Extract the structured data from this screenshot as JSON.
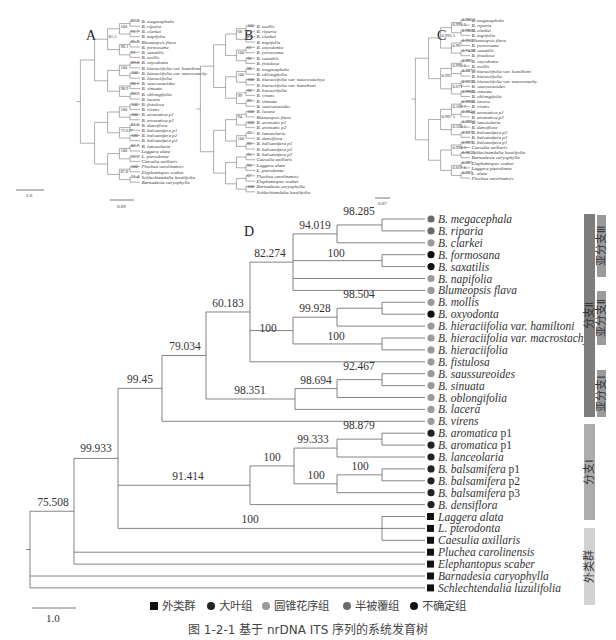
{
  "figure": {
    "caption": "图 1-2-1   基于 nrDNA ITS 序列的系统发育树",
    "legend": [
      {
        "symbol": "square",
        "color": "#111111",
        "label": "外类群"
      },
      {
        "symbol": "circle",
        "color": "#222222",
        "label": "大叶组"
      },
      {
        "symbol": "circle",
        "color": "#9a9a9a",
        "label": "圆锥花序组"
      },
      {
        "symbol": "circle",
        "color": "#6a6a6a",
        "label": "半被覆组"
      },
      {
        "symbol": "circle",
        "color": "#111111",
        "label": "不确定组"
      }
    ]
  },
  "panels": {
    "A": {
      "label": "A",
      "scale": "2.0",
      "taxa": [
        "B. megacephala",
        "B. riparia",
        "B. clarkei",
        "B. napifolia",
        "Blumeopsis flava",
        "B. formosana",
        "B. saxatilis",
        "B. mollis",
        "B. oxyodonta",
        "B. hieraciifolia var. hamiltoni",
        "B. hieraciifolia var. macrostachy",
        "B. hieraciifolia",
        "B. saussureoides",
        "B. sinuata",
        "B. oblongifolia",
        "B. lacera",
        "B. fistulosa",
        "B. virens",
        "B. aromatica p1",
        "B. aromatica p2",
        "B. densiflora",
        "B. balsamifera p1",
        "B. balsamifera p2",
        "B. balsamifera p3",
        "B. lanceolaria",
        "Laggera alata",
        "L. pterodonta",
        "Caesulia axillaris",
        "Pluchea carolinensis",
        "Elephantopus scaber",
        "Schlechtendalia luzulifolia",
        "Barnadesia caryophylla"
      ],
      "supports": [
        "97.9",
        "91.7",
        "85.9",
        "91",
        "89.8",
        "100",
        "98.1",
        "99.7",
        "100",
        "100",
        "81.6",
        "100",
        "82.7",
        "52.2",
        "100",
        "71.4",
        "100",
        "98.1",
        "100",
        "98.9",
        "100",
        "72.617",
        "100",
        "87.8",
        "81.5"
      ]
    },
    "B": {
      "label": "B",
      "scale": "0.09",
      "taxa": [
        "B. mollis",
        "B. riparia",
        "B. clarkei",
        "B. napifolia",
        "B. oxyodonta",
        "B. formosana",
        "B. saxatilis",
        "B. fistulosa",
        "B. megacephala",
        "B. oblongifolia",
        "B. hieraciifolia var. macrostachya",
        "B. hieraciifolia var. hamiltoni",
        "B. hieraciifolia",
        "B. virens",
        "B. sinuata",
        "B. saussureoides",
        "B. lacera",
        "Blumeopsis flava",
        "B. aromatic p1",
        "B. aromatic p2",
        "B. lanceolaria",
        "B. densiflora",
        "B. balsamifera p1",
        "B. balsamifera p2",
        "B. balsamifera p3",
        "Caesulia axillaris",
        "Laggera alata",
        "L. pterodonta",
        "Pluchea carolinensis",
        "Elephantopus scaber",
        "Barnadesia caryophylla",
        "Schlechtendalia luzulifolia"
      ],
      "supports": [
        "100",
        "97",
        "61",
        "96",
        "98",
        "100",
        "98",
        "99",
        "100",
        "100",
        "73",
        "99",
        "95",
        "99",
        "67",
        "100",
        "68",
        "100",
        "100",
        "99",
        "94",
        "100"
      ]
    },
    "C": {
      "label": "C",
      "scale": "0.07",
      "taxa": [
        "B. megacephala",
        "B. riparia",
        "B. clarkei",
        "B. napifolia",
        "Blumeopsis flava",
        "B. formosana",
        "B. saxatilis",
        "B. fistulosa",
        "B. oxyodonta",
        "B. mollis",
        "B. hieraciifolia var. hamiltoni",
        "B. hieraciifolia",
        "B. hieraciifolia var. macrostachy",
        "B. saussureoides",
        "B. sinuata",
        "B. oblongifolia",
        "B. lacera",
        "B. virens",
        "B. aromatica p1",
        "B. aromatica p2",
        "B. lanceolaria",
        "B. densiflora",
        "B. balsamifera p3",
        "B. balsamifera p2",
        "B. balsamifera p1",
        "Caesulia axillaris",
        "Schlechtendalia luzulifolia",
        "Barnadesia caryophylla",
        "Elephantopus scaber",
        "Laggera pterodonta",
        "L. alata",
        "Pluchea carolinensis"
      ],
      "supports": [
        "0.986 5",
        "0.986 5",
        "0.936",
        "0.741 6",
        "0.992",
        "0.997 5",
        "0.622 5",
        "0.998 5",
        "0.998 5",
        "0.984 5",
        "0.998 5",
        "0.627",
        "0.997",
        "0.962 5",
        "0.997",
        "0.992",
        "0.991 5",
        "0.96",
        "0.995 5",
        "0.671",
        "0.566 7",
        "0.560 1",
        "0.994 5",
        "0.667 6",
        "0.995 5",
        "0.993",
        "0.987 5"
      ]
    },
    "D": {
      "label": "D",
      "scale": "1.0",
      "supports": {
        "megacephala_riparia": "98.285",
        "megacephala_clarkei": "94.019",
        "formosana_saxatilis": "100",
        "clade_III": "82.274",
        "mollis_oxyodonta": "98.504",
        "mollis_hamiltoni": "99.928",
        "macrostachy_hieraciifolia": "100",
        "clade_II": "100",
        "clade_III_II": "60.183",
        "saussureoides_sinuata": "92.467",
        "saussureoides_oblongifolia": "98.694",
        "clade_I_sub": "98.351",
        "branch_II_all": "79.034",
        "branch_II_virens": "99.45",
        "aromatica_pair": "98.879",
        "aromatica_lanceolaria": "99.333",
        "balsamifera_pair": "100",
        "balsamifera_all": "100",
        "aromatica_balsamifera": "100",
        "branch_I": "91.414",
        "laggera_caesulia": "100",
        "ingroup": "99.933",
        "root": "75.508"
      },
      "taxa": [
        {
          "name": "B. megacephala",
          "group": "半被覆组",
          "marker": "circle",
          "color": "#6a6a6a"
        },
        {
          "name": "B. riparia",
          "group": "半被覆组",
          "marker": "circle",
          "color": "#6a6a6a"
        },
        {
          "name": "B. clarkei",
          "group": "圆锥花序组",
          "marker": "circle",
          "color": "#9a9a9a"
        },
        {
          "name": "B. formosana",
          "group": "不确定组",
          "marker": "circle",
          "color": "#111111"
        },
        {
          "name": "B. saxatilis",
          "group": "不确定组",
          "marker": "circle",
          "color": "#111111"
        },
        {
          "name": "B. napifolia",
          "group": "圆锥花序组",
          "marker": "circle",
          "color": "#9a9a9a"
        },
        {
          "name": "Blumeopsis flava",
          "group": "圆锥花序组",
          "marker": "circle",
          "color": "#9a9a9a"
        },
        {
          "name": "B. mollis",
          "group": "圆锥花序组",
          "marker": "circle",
          "color": "#9a9a9a"
        },
        {
          "name": "B. oxyodonta",
          "group": "不确定组",
          "marker": "circle",
          "color": "#111111"
        },
        {
          "name": "B. hieraciifolia var. hamiltoni",
          "group": "圆锥花序组",
          "marker": "circle",
          "color": "#9a9a9a"
        },
        {
          "name": "B. hieraciifolia var. macrostachy",
          "group": "圆锥花序组",
          "marker": "circle",
          "color": "#9a9a9a"
        },
        {
          "name": "B. hieraciifolia",
          "group": "圆锥花序组",
          "marker": "circle",
          "color": "#9a9a9a"
        },
        {
          "name": "B. fistulosa",
          "group": "圆锥花序组",
          "marker": "circle",
          "color": "#9a9a9a"
        },
        {
          "name": "B. saussureoides",
          "group": "圆锥花序组",
          "marker": "circle",
          "color": "#9a9a9a"
        },
        {
          "name": "B. sinuata",
          "group": "圆锥花序组",
          "marker": "circle",
          "color": "#9a9a9a"
        },
        {
          "name": "B. oblongifolia",
          "group": "圆锥花序组",
          "marker": "circle",
          "color": "#9a9a9a"
        },
        {
          "name": "B. lacera",
          "group": "圆锥花序组",
          "marker": "circle",
          "color": "#9a9a9a"
        },
        {
          "name": "B. virens",
          "group": "圆锥花序组",
          "marker": "circle",
          "color": "#9a9a9a"
        },
        {
          "name": "B. aromatica",
          "suffix": " p1",
          "group": "大叶组",
          "marker": "circle",
          "color": "#222222"
        },
        {
          "name": "B. aromatica",
          "suffix": " p1",
          "group": "大叶组",
          "marker": "circle",
          "color": "#222222"
        },
        {
          "name": "B. lanceolaria",
          "group": "大叶组",
          "marker": "circle",
          "color": "#222222"
        },
        {
          "name": "B. balsamifera",
          "suffix": " p1",
          "group": "大叶组",
          "marker": "circle",
          "color": "#222222"
        },
        {
          "name": "B. balsamifera",
          "suffix": " p2",
          "group": "大叶组",
          "marker": "circle",
          "color": "#222222"
        },
        {
          "name": "B. balsamifera",
          "suffix": " p3",
          "group": "大叶组",
          "marker": "circle",
          "color": "#222222"
        },
        {
          "name": "B. densiflora",
          "group": "大叶组",
          "marker": "circle",
          "color": "#222222"
        },
        {
          "name": "Laggera alata",
          "group": "外类群",
          "marker": "square",
          "color": "#111111"
        },
        {
          "name": "L. pterodonta",
          "group": "外类群",
          "marker": "square",
          "color": "#111111"
        },
        {
          "name": "Caesulia axillaris",
          "group": "外类群",
          "marker": "square",
          "color": "#111111"
        },
        {
          "name": "Pluchea carolinensis",
          "group": "外类群",
          "marker": "square",
          "color": "#111111"
        },
        {
          "name": "Elephantopus scaber",
          "group": "外类群",
          "marker": "square",
          "color": "#111111"
        },
        {
          "name": "Barnadesia caryophylla",
          "group": "外类群",
          "marker": "square",
          "color": "#111111"
        },
        {
          "name": "Schlechtendalia luzulifolia",
          "group": "外类群",
          "marker": "square",
          "color": "#111111"
        }
      ],
      "clade_bars": [
        {
          "label": "分支Ⅱ",
          "color": "#7d7d7d"
        },
        {
          "label": "亚分支Ⅲ",
          "color": "#9a9a9a"
        },
        {
          "label": "亚分支Ⅱ",
          "color": "#9a9a9a"
        },
        {
          "label": "亚分支Ⅰ",
          "color": "#9a9a9a"
        },
        {
          "label": "分支Ⅰ",
          "color": "#adadad"
        },
        {
          "label": "外类群",
          "color": "#d2d2d2"
        }
      ]
    }
  }
}
